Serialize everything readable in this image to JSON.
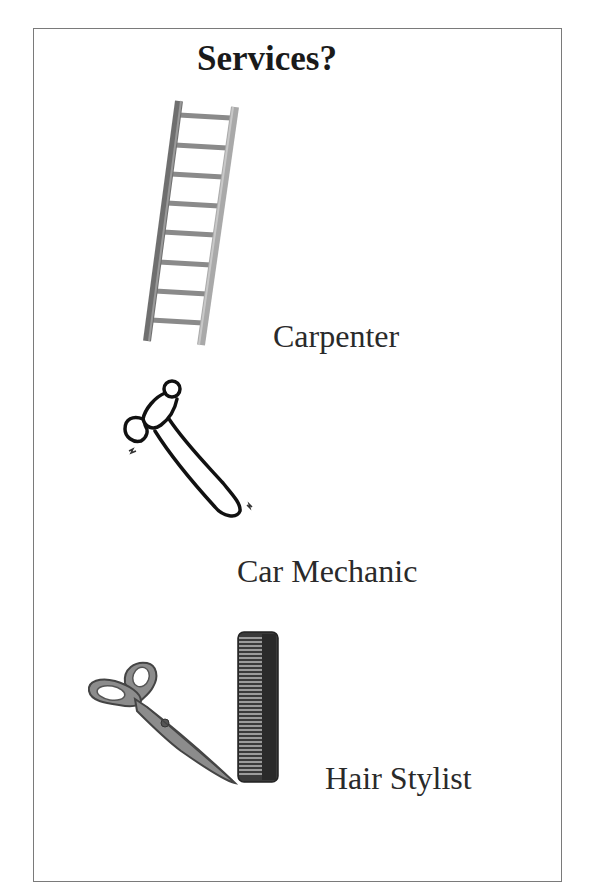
{
  "page": {
    "title": "Services?",
    "items": [
      {
        "label": "Carpenter",
        "icon": "ladder-icon"
      },
      {
        "label": "Car Mechanic",
        "icon": "hammer-icon"
      },
      {
        "label": "Hair Stylist",
        "icon": "scissors-and-comb-icon"
      }
    ]
  },
  "colors": {
    "frame_border": "#7a7a7a",
    "text": "#2a2a2a"
  }
}
